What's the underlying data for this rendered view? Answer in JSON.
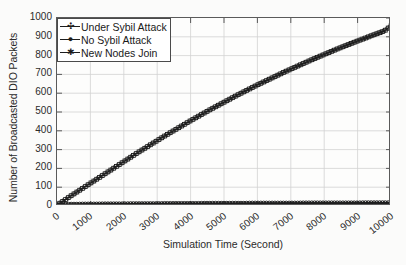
{
  "chart_data": {
    "type": "line",
    "title": "",
    "xlabel": "Simulation Time (Second)",
    "ylabel": "Number of Broadcasted DIO Packets",
    "xlim": [
      0,
      10000
    ],
    "ylim": [
      0,
      1000
    ],
    "xticks": [
      0,
      1000,
      2000,
      3000,
      4000,
      5000,
      6000,
      7000,
      8000,
      9000,
      10000
    ],
    "yticks": [
      0,
      100,
      200,
      300,
      400,
      500,
      600,
      700,
      800,
      900,
      1000
    ],
    "xtick_labels": [
      "0",
      "1000",
      "2000",
      "3000",
      "4000",
      "5000",
      "6000",
      "7000",
      "8000",
      "9000",
      "10000"
    ],
    "ytick_labels": [
      "0",
      "100",
      "200",
      "300",
      "400",
      "500",
      "600",
      "700",
      "800",
      "900",
      "1000"
    ],
    "grid": true,
    "legend_position": "upper left (inside axes)",
    "x": [
      0,
      200,
      400,
      600,
      800,
      1000,
      1200,
      1400,
      1600,
      1800,
      2000,
      2200,
      2400,
      2600,
      2800,
      3000,
      3200,
      3400,
      3600,
      3800,
      4000,
      4200,
      4400,
      4600,
      4800,
      5000,
      5200,
      5400,
      5600,
      5800,
      6000,
      6200,
      6400,
      6600,
      6800,
      7000,
      7200,
      7400,
      7600,
      7800,
      8000,
      8200,
      8400,
      8600,
      8800,
      9000,
      9200,
      9400,
      9600,
      9800,
      10000
    ],
    "series": [
      {
        "name": "Under Sybil Attack",
        "marker": "plus-square",
        "color": "#1d1d1d",
        "values": [
          5,
          28,
          52,
          75,
          98,
          121,
          144,
          167,
          190,
          213,
          236,
          259,
          282,
          304,
          326,
          348,
          370,
          391,
          412,
          433,
          454,
          474,
          494,
          514,
          533,
          552,
          571,
          590,
          608,
          626,
          644,
          661,
          678,
          695,
          712,
          728,
          744,
          760,
          776,
          791,
          806,
          821,
          836,
          850,
          864,
          878,
          891,
          905,
          918,
          931,
          958
        ]
      },
      {
        "name": "No Sybil Attack",
        "marker": "circle-dot",
        "color": "#1d1d1d",
        "values": [
          4,
          9,
          10,
          10,
          11,
          11,
          11,
          12,
          12,
          12,
          12,
          13,
          13,
          13,
          13,
          13,
          14,
          14,
          14,
          14,
          14,
          14,
          15,
          15,
          15,
          15,
          15,
          15,
          15,
          16,
          16,
          16,
          16,
          16,
          16,
          16,
          16,
          17,
          17,
          17,
          17,
          17,
          17,
          17,
          17,
          17,
          18,
          18,
          18,
          18,
          18
        ]
      },
      {
        "name": "New Nodes Join",
        "marker": "star",
        "color": "#1d1d1d",
        "values": [
          3,
          7,
          8,
          8,
          9,
          9,
          9,
          10,
          10,
          10,
          10,
          10,
          11,
          11,
          11,
          11,
          11,
          11,
          12,
          12,
          12,
          12,
          12,
          12,
          12,
          13,
          13,
          13,
          13,
          13,
          13,
          13,
          13,
          13,
          14,
          14,
          14,
          14,
          14,
          14,
          14,
          14,
          14,
          14,
          15,
          15,
          15,
          15,
          15,
          15,
          15
        ]
      }
    ]
  },
  "legend": {
    "items": [
      {
        "label": "Under Sybil Attack",
        "marker_glyph": "✣"
      },
      {
        "label": "No Sybil Attack",
        "marker_glyph": "●"
      },
      {
        "label": "New Nodes Join",
        "marker_glyph": "✱"
      }
    ]
  }
}
